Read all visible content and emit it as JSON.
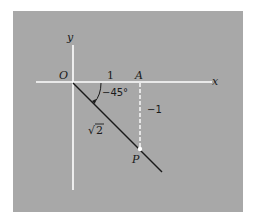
{
  "figure": {
    "type": "coordinate-diagram",
    "background_color": "#ffffff",
    "panel_color": "#a8a8a8",
    "axis_color": "#ffffff",
    "line_color": "#1a1a1a"
  },
  "axes": {
    "x_label": "x",
    "y_label": "y",
    "origin_label": "O"
  },
  "labels": {
    "tick_one": "1",
    "point_a": "A",
    "point_p": "P",
    "angle": "−45°",
    "vertical_length": "−1",
    "hypotenuse_radical": "√",
    "hypotenuse_value": "2"
  },
  "geometry": {
    "origin": [
      73,
      82
    ],
    "point_a": [
      140,
      82
    ],
    "point_p": [
      140,
      149
    ],
    "ray_end": [
      162,
      172
    ]
  }
}
